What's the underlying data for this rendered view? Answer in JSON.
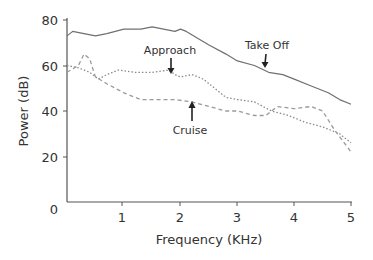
{
  "chart_data": {
    "type": "line",
    "title": "",
    "xlabel": "Frequency (KHz)",
    "ylabel": "Power (dB)",
    "xlim": [
      0,
      5
    ],
    "ylim": [
      0,
      80
    ],
    "xticks": [
      1,
      2,
      3,
      4,
      5
    ],
    "yticks": [
      0,
      20,
      40,
      60,
      80
    ],
    "x_origin_label": "0",
    "grid": false,
    "legend": "none (inline annotations with arrows)",
    "series": [
      {
        "name": "Take Off",
        "style": "solid",
        "x": [
          0.0,
          0.1,
          0.3,
          0.5,
          0.7,
          1.0,
          1.3,
          1.5,
          1.7,
          1.9,
          2.0,
          2.1,
          2.3,
          2.5,
          2.8,
          3.0,
          3.3,
          3.55,
          3.8,
          4.0,
          4.3,
          4.6,
          4.8,
          5.0
        ],
        "y": [
          73,
          75,
          74,
          73,
          74,
          76,
          76,
          77,
          76,
          75,
          76,
          75,
          72,
          69,
          65,
          62,
          60,
          57,
          56,
          54,
          51,
          48,
          45,
          43
        ]
      },
      {
        "name": "Approach",
        "style": "dotted",
        "x": [
          0.0,
          0.2,
          0.4,
          0.55,
          0.7,
          0.9,
          1.2,
          1.5,
          1.8,
          1.9,
          2.0,
          2.2,
          2.4,
          2.6,
          2.8,
          3.0,
          3.3,
          3.6,
          3.9,
          4.2,
          4.5,
          4.8,
          5.0
        ],
        "y": [
          60,
          59,
          57,
          54,
          56,
          58,
          57,
          57,
          58,
          56,
          55,
          56,
          54,
          50,
          46,
          45,
          44,
          40,
          38,
          35,
          33,
          30,
          26
        ]
      },
      {
        "name": "Cruise",
        "style": "dashed",
        "x": [
          0.0,
          0.2,
          0.3,
          0.4,
          0.5,
          0.7,
          1.0,
          1.3,
          1.6,
          1.9,
          2.2,
          2.5,
          2.8,
          3.0,
          3.3,
          3.5,
          3.7,
          4.0,
          4.3,
          4.5,
          4.7,
          5.0
        ],
        "y": [
          57,
          60,
          65,
          63,
          55,
          52,
          48,
          45,
          45,
          45,
          44,
          42,
          40,
          40,
          38,
          38,
          42,
          41,
          42,
          40,
          32,
          22
        ]
      }
    ],
    "annotations": [
      {
        "text": "Take Off",
        "arrow": "down",
        "points_to_x": 3.55,
        "points_to_y": 57
      },
      {
        "text": "Approach",
        "arrow": "down",
        "points_to_x": 1.9,
        "points_to_y": 56
      },
      {
        "text": "Cruise",
        "arrow": "up",
        "points_to_x": 2.25,
        "points_to_y": 45
      }
    ]
  },
  "labels": {
    "xlabel": "Frequency (KHz)",
    "ylabel": "Power (dB)",
    "x_ticks": [
      "1",
      "2",
      "3",
      "4",
      "5"
    ],
    "y_ticks": [
      "80",
      "60",
      "40",
      "20",
      "0"
    ],
    "annot_takeoff": "Take Off",
    "annot_approach": "Approach",
    "annot_cruise": "Cruise"
  },
  "colors": {
    "axis": "#555555",
    "takeoff": "#707070",
    "approach": "#8a8a8a",
    "cruise": "#9a9a9a",
    "arrow": "#222222"
  }
}
